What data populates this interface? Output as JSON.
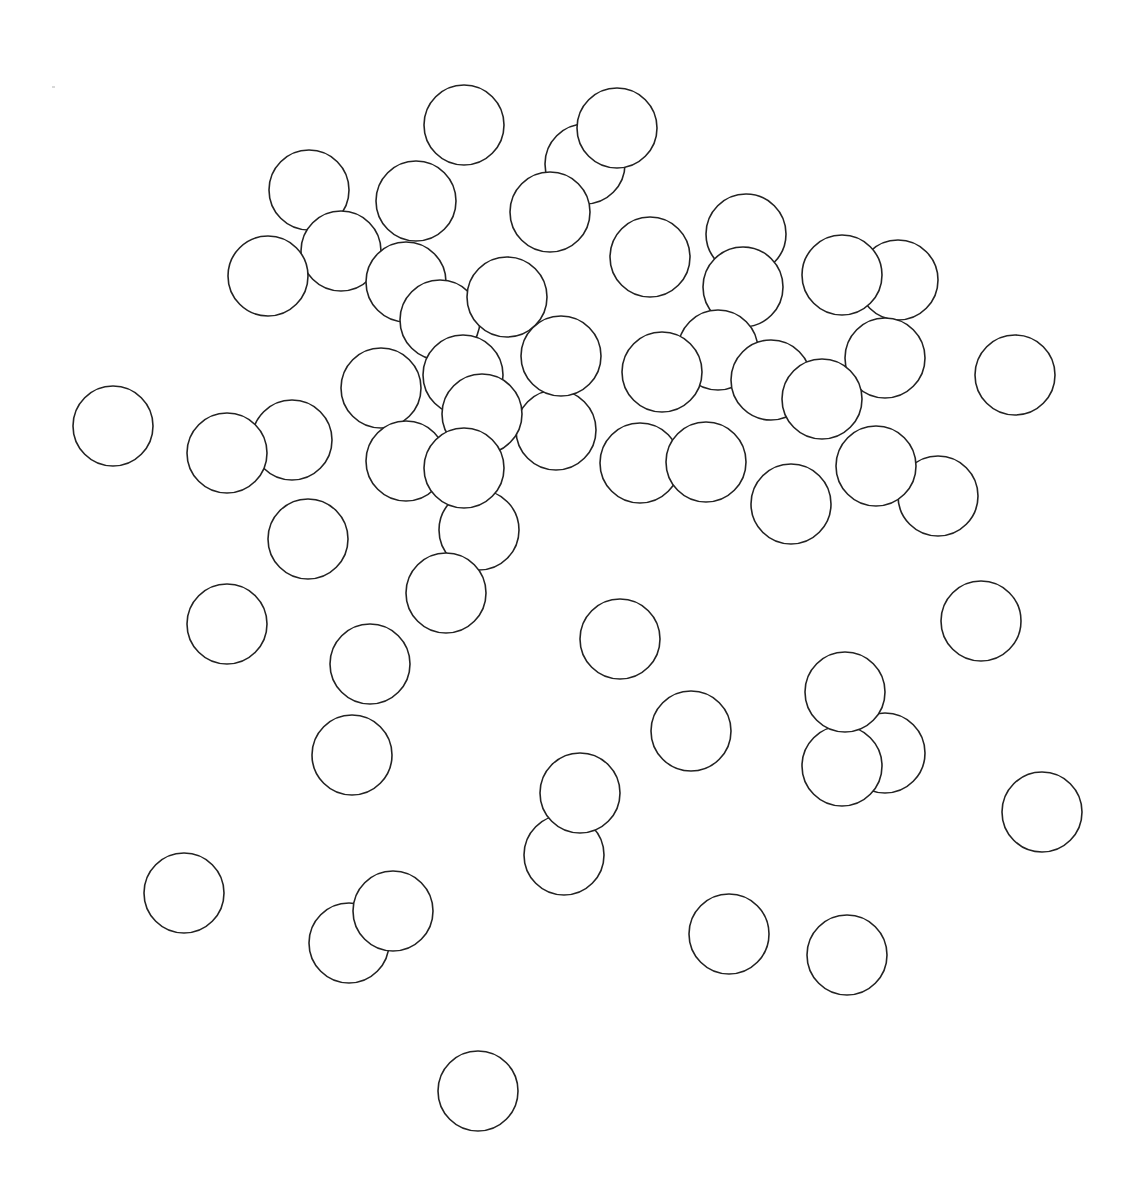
{
  "canvas": {
    "width": 1139,
    "height": 1186,
    "background": "#ffffff",
    "stroke_color": "#222222",
    "fill_color": "#ffffff",
    "radius": 40
  },
  "artifacts": [
    {
      "x": 52,
      "y": 86,
      "w": 3,
      "h": 2
    }
  ],
  "circles": [
    {
      "x": 309,
      "y": 190
    },
    {
      "x": 341,
      "y": 251
    },
    {
      "x": 268,
      "y": 276
    },
    {
      "x": 464,
      "y": 125
    },
    {
      "x": 585,
      "y": 164
    },
    {
      "x": 617,
      "y": 128
    },
    {
      "x": 550,
      "y": 212
    },
    {
      "x": 416,
      "y": 201
    },
    {
      "x": 406,
      "y": 282
    },
    {
      "x": 440,
      "y": 320
    },
    {
      "x": 507,
      "y": 297
    },
    {
      "x": 650,
      "y": 257
    },
    {
      "x": 746,
      "y": 234
    },
    {
      "x": 743,
      "y": 287
    },
    {
      "x": 898,
      "y": 280
    },
    {
      "x": 842,
      "y": 275
    },
    {
      "x": 718,
      "y": 350
    },
    {
      "x": 885,
      "y": 358
    },
    {
      "x": 771,
      "y": 380
    },
    {
      "x": 822,
      "y": 399
    },
    {
      "x": 662,
      "y": 372
    },
    {
      "x": 1015,
      "y": 375
    },
    {
      "x": 463,
      "y": 375
    },
    {
      "x": 381,
      "y": 388
    },
    {
      "x": 556,
      "y": 430
    },
    {
      "x": 561,
      "y": 356
    },
    {
      "x": 482,
      "y": 414
    },
    {
      "x": 113,
      "y": 426
    },
    {
      "x": 292,
      "y": 440
    },
    {
      "x": 227,
      "y": 453
    },
    {
      "x": 406,
      "y": 461
    },
    {
      "x": 479,
      "y": 530
    },
    {
      "x": 464,
      "y": 468
    },
    {
      "x": 640,
      "y": 463
    },
    {
      "x": 706,
      "y": 462
    },
    {
      "x": 938,
      "y": 496
    },
    {
      "x": 876,
      "y": 466
    },
    {
      "x": 791,
      "y": 504
    },
    {
      "x": 308,
      "y": 539
    },
    {
      "x": 446,
      "y": 593
    },
    {
      "x": 227,
      "y": 624
    },
    {
      "x": 981,
      "y": 621
    },
    {
      "x": 620,
      "y": 639
    },
    {
      "x": 370,
      "y": 664
    },
    {
      "x": 691,
      "y": 731
    },
    {
      "x": 352,
      "y": 755
    },
    {
      "x": 885,
      "y": 753
    },
    {
      "x": 842,
      "y": 766
    },
    {
      "x": 845,
      "y": 692
    },
    {
      "x": 1042,
      "y": 812
    },
    {
      "x": 564,
      "y": 855
    },
    {
      "x": 580,
      "y": 793
    },
    {
      "x": 184,
      "y": 893
    },
    {
      "x": 349,
      "y": 943
    },
    {
      "x": 393,
      "y": 911
    },
    {
      "x": 729,
      "y": 934
    },
    {
      "x": 847,
      "y": 955
    },
    {
      "x": 478,
      "y": 1091
    }
  ]
}
